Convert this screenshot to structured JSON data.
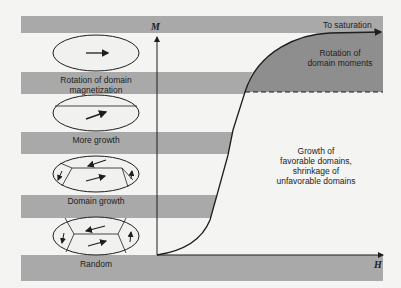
{
  "figure": {
    "axes": {
      "y_label": "M",
      "x_label": "H"
    },
    "regions": {
      "saturation_label": "To saturation",
      "rotation_region_label_line1": "Rotation of",
      "rotation_region_label_line2": "domain moments",
      "growth_region_label_line1": "Growth of",
      "growth_region_label_line2": "favorable domains,",
      "growth_region_label_line3": "shrinkage of",
      "growth_region_label_line4": "unfavorable domains"
    },
    "stages": [
      {
        "label_line1": "Rotation of domain",
        "label_line2": "magnetization",
        "icon": "single-domain-aligned-icon"
      },
      {
        "label_line1": "More growth",
        "label_line2": "",
        "icon": "single-domain-tilted-icon"
      },
      {
        "label_line1": "Domain growth",
        "label_line2": "",
        "icon": "multi-domain-growing-icon"
      },
      {
        "label_line1": "Random",
        "label_line2": "",
        "icon": "multi-domain-random-icon"
      }
    ],
    "colors": {
      "background": "#f4f4f2",
      "band_gray": "#a9a9a9",
      "dark_region": "#8e8e8e",
      "ink": "#1e1e1e",
      "ellipse_fill": "#f1f1ef"
    }
  }
}
